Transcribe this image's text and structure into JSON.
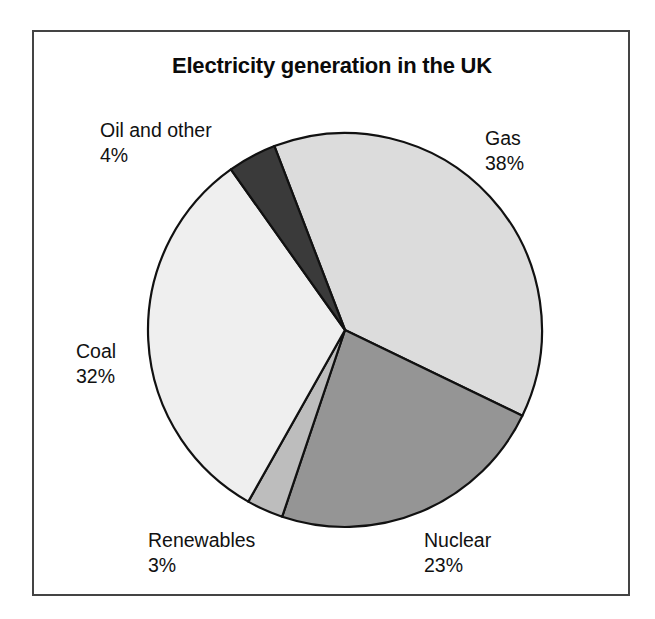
{
  "figure": {
    "title": "Electricity generation in the UK",
    "background_color": "#ffffff",
    "frame_color": "#444444"
  },
  "chart_data": {
    "type": "pie",
    "title": "Electricity generation in the UK",
    "xlabel": "",
    "ylabel": "",
    "categories": [
      "Gas",
      "Nuclear",
      "Renewables",
      "Coal",
      "Oil and other"
    ],
    "values": [
      38,
      23,
      3,
      32,
      4
    ],
    "value_unit": "%",
    "start_angle_deg_from_12oclock": -21,
    "direction": "clockwise",
    "legend": "none",
    "labels_position": "outside",
    "slices": [
      {
        "name": "Gas",
        "value": 38,
        "label": "Gas",
        "percent_label": "38%",
        "color": "#dcdcdc",
        "label_anchor": "right-top"
      },
      {
        "name": "Nuclear",
        "value": 23,
        "label": "Nuclear",
        "percent_label": "23%",
        "color": "#959595",
        "label_anchor": "bottom-right"
      },
      {
        "name": "Renewables",
        "value": 3,
        "label": "Renewables",
        "percent_label": "3%",
        "color": "#bdbdbd",
        "label_anchor": "bottom-left"
      },
      {
        "name": "Coal",
        "value": 32,
        "label": "Coal",
        "percent_label": "32%",
        "color": "#efefef",
        "label_anchor": "left"
      },
      {
        "name": "Oil and other",
        "value": 4,
        "label": "Oil and other",
        "percent_label": "4%",
        "color": "#3a3a3a",
        "label_anchor": "left-top"
      }
    ]
  },
  "labels": {
    "oil": {
      "name": "Oil and other",
      "percent": "4%"
    },
    "gas": {
      "name": "Gas",
      "percent": "38%"
    },
    "coal": {
      "name": "Coal",
      "percent": "32%"
    },
    "renewables": {
      "name": "Renewables",
      "percent": "3%"
    },
    "nuclear": {
      "name": "Nuclear",
      "percent": "23%"
    }
  }
}
